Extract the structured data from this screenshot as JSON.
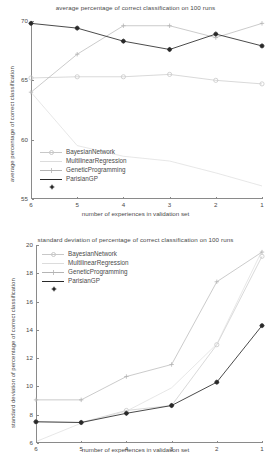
{
  "charts": [
    {
      "id": "avg-chart",
      "title": "average percentage of correct classification on 100 runs",
      "xlabel": "number of experiences in validation set",
      "ylabel": "average percentage of correct classification",
      "ytick_labels": [
        "55",
        "60",
        "65",
        "70"
      ],
      "xtick_labels": [
        "6",
        "5",
        "4",
        "3",
        "2",
        "1"
      ],
      "legend": [
        "BayesianNetwork",
        "MultilinearRegression",
        "GeneticProgramming",
        "ParisianGP"
      ]
    },
    {
      "id": "std-chart",
      "title": "standard deviation of percentage of correct classification on 100 runs",
      "xlabel": "number of experiences in validation set",
      "ylabel": "standard deviation of percentage of correct classification",
      "ytick_labels": [
        "6",
        "8",
        "10",
        "12",
        "14",
        "16",
        "18",
        "20"
      ],
      "xtick_labels": [
        "6",
        "5",
        "4",
        "3",
        "2",
        "1"
      ],
      "legend": [
        "BayesianNetwork",
        "MultilinearRegression",
        "GeneticProgramming",
        "ParisianGP"
      ]
    }
  ],
  "chart_data": [
    {
      "type": "line",
      "title": "average percentage of correct classification on 100 runs",
      "xlabel": "number of experiences in validation set",
      "ylabel": "average percentage of correct classification",
      "x": [
        6,
        5,
        4,
        3,
        2,
        1
      ],
      "xlim": [
        6,
        1
      ],
      "ylim": [
        55,
        70
      ],
      "yticks": [
        55,
        60,
        65,
        70
      ],
      "grid": false,
      "legend_position": "lower-left",
      "series": [
        {
          "name": "BayesianNetwork",
          "color": "#c8c8c8",
          "marker": "circle-open",
          "values": [
            65.2,
            65.3,
            65.3,
            65.5,
            65.0,
            64.7
          ]
        },
        {
          "name": "MultilinearRegression",
          "color": "#dcdcdc",
          "marker": "none",
          "values": [
            64.0,
            59.5,
            58.6,
            58.2,
            57.2,
            56.1
          ]
        },
        {
          "name": "GeneticProgramming",
          "color": "#b4b4b4",
          "marker": "plus",
          "values": [
            64.0,
            67.2,
            69.6,
            69.6,
            68.6,
            69.8
          ]
        },
        {
          "name": "ParisianGP",
          "color": "#2a2a2a",
          "marker": "star-filled",
          "values": [
            69.8,
            69.4,
            68.3,
            67.6,
            68.9,
            67.9
          ]
        }
      ]
    },
    {
      "type": "line",
      "title": "standard deviation of percentage of correct classification on 100 runs",
      "xlabel": "number of experiences in validation set",
      "ylabel": "standard deviation of percentage of correct classification",
      "x": [
        6,
        5,
        4,
        3,
        2,
        1
      ],
      "xlim": [
        6,
        1
      ],
      "ylim": [
        6,
        20
      ],
      "yticks": [
        6,
        8,
        10,
        12,
        14,
        16,
        18,
        20
      ],
      "grid": false,
      "legend_position": "upper-left",
      "series": [
        {
          "name": "BayesianNetwork",
          "color": "#c8c8c8",
          "marker": "circle-open",
          "values": [
            7.5,
            7.45,
            8.3,
            8.65,
            12.95,
            19.2
          ]
        },
        {
          "name": "MultilinearRegression",
          "color": "#dcdcdc",
          "marker": "none",
          "values": [
            6.1,
            7.4,
            8.25,
            9.9,
            13.0,
            19.6
          ]
        },
        {
          "name": "GeneticProgramming",
          "color": "#b4b4b4",
          "marker": "plus",
          "values": [
            9.05,
            9.05,
            10.7,
            11.55,
            17.4,
            19.5
          ]
        },
        {
          "name": "ParisianGP",
          "color": "#2a2a2a",
          "marker": "star-filled",
          "values": [
            7.5,
            7.45,
            8.1,
            8.65,
            10.3,
            14.3
          ]
        }
      ]
    }
  ]
}
